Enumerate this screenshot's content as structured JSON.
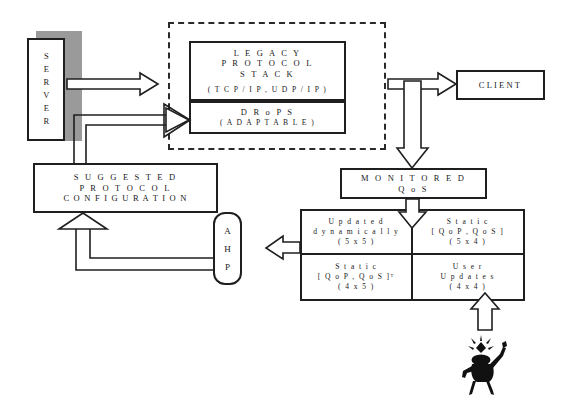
{
  "diagram": {
    "nodes": {
      "server": {
        "label": "SERVER"
      },
      "client": {
        "label": "CLIENT"
      },
      "legacy_stack": {
        "line1": "L E G A C Y",
        "line2": "P R O T O C O L",
        "line3": "S T A C K",
        "line4": "( T C P / I P ,  U D P / I P )"
      },
      "drops": {
        "line1": "D R o P S",
        "line2": "( A D A P T A B L E )"
      },
      "suggested_config": {
        "line1": "S U G G E S T E D",
        "line2": "P R O T O C O L",
        "line3": "C O N F I G U R A T I O N"
      },
      "monitored_qos": {
        "line1": "M O N I T O R E D",
        "line2": "Q o S"
      },
      "ahp": {
        "l1": "A",
        "l2": "H",
        "l3": "P"
      }
    },
    "qos_matrix": {
      "cells": [
        {
          "line1": "U p d a t e d",
          "line2": "d y n a m i c a l l y",
          "line3": "( 5 x 5 )"
        },
        {
          "line1": "S t a t i c",
          "line2": "[ Q o P , Q o S ]",
          "line3": "( 5 x 4 )"
        },
        {
          "line1": "S t a t i c",
          "line2": "[ Q o P , Q o S ]ᵀ",
          "line3": "( 4 x 5 )"
        },
        {
          "line1": "U s e r",
          "line2": "U p d a t e s",
          "line3": "( 4 x 4 )"
        }
      ]
    },
    "icons": {
      "person": "user-idea-figure-icon",
      "arrow_server_to_stack": "block-arrow-right-icon",
      "arrow_config_to_drops": "block-arrow-right-icon",
      "arrow_stack_to_client": "block-arrow-right-icon",
      "arrow_stack_to_qos": "block-arrow-down-icon",
      "arrow_qos_to_matrix": "block-arrow-down-icon",
      "arrow_matrix_to_ahp": "block-arrow-left-icon",
      "arrow_ahp_to_config": "block-arrow-up-icon",
      "arrow_user_to_matrix": "block-arrow-up-icon"
    },
    "colors": {
      "stroke": "#1f1f1f",
      "shadow": "#9a9a9a",
      "background": "#ffffff",
      "figure": "#111111"
    }
  }
}
